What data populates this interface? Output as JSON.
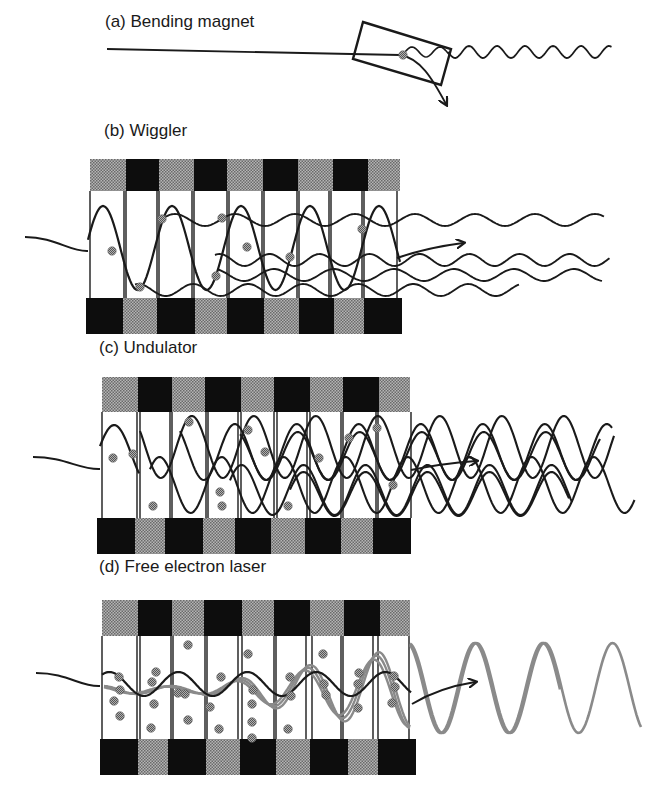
{
  "figure": {
    "colors": {
      "line": "#1a1a1a",
      "magnet_dark": "#0d0d0d",
      "magnet_light": "#8f8f8f",
      "electron": "#7a7a7a",
      "fel_wave": "#8a8a8a",
      "background": "#ffffff"
    },
    "panels": [
      {
        "id": "a",
        "label": "(a) Bending magnet",
        "label_pos": [
          105,
          22
        ],
        "type": "bending-magnet",
        "beam_in": [
          [
            107,
            49
          ],
          [
            400,
            55
          ]
        ],
        "box": [
          [
            363,
            22
          ],
          [
            451,
            49
          ],
          [
            441,
            85
          ],
          [
            353,
            59
          ]
        ],
        "electron": [
          403,
          55
        ],
        "arrow_tip": [
          446,
          106
        ],
        "emitted_wave": {
          "x0": 448,
          "x1": 612,
          "y": 52,
          "amp": 6,
          "period": 28
        }
      },
      {
        "id": "b",
        "label": "(b) Wiggler",
        "label_pos": [
          104,
          131
        ],
        "type": "wiggler",
        "top_magnets": {
          "x0": 90,
          "y": 159,
          "h": 32,
          "widths": [
            36,
            33,
            35,
            33,
            36,
            35,
            35,
            35,
            32
          ],
          "start": "light"
        },
        "bottom_magnets": {
          "x0": 86,
          "y": 298,
          "h": 36,
          "widths": [
            37,
            34,
            38,
            32,
            37,
            35,
            35,
            30,
            38
          ],
          "start": "dark"
        },
        "gap": {
          "y0": 191,
          "y1": 298
        },
        "dividers": [
          90,
          124,
          126,
          157,
          159,
          192,
          194,
          227,
          229,
          262,
          264,
          297,
          299,
          329,
          331,
          362,
          364,
          397
        ],
        "wave_count": 4,
        "arrow": {
          "from": [
            400,
            253
          ],
          "to": [
            465,
            243
          ]
        },
        "electrons": [
          [
            112,
            251
          ],
          [
            140,
            287
          ],
          [
            162,
            219
          ],
          [
            216,
            276
          ],
          [
            222,
            218
          ],
          [
            247,
            247
          ],
          [
            290,
            257
          ],
          [
            362,
            229
          ]
        ]
      },
      {
        "id": "c",
        "label": "(c) Undulator",
        "label_pos": [
          99,
          348
        ],
        "type": "undulator",
        "top_magnets": {
          "x0": 102,
          "y": 377,
          "h": 35,
          "widths": [
            36,
            34,
            33,
            36,
            33,
            36,
            33,
            36,
            31
          ],
          "start": "light"
        },
        "bottom_magnets": {
          "x0": 97,
          "y": 518,
          "h": 36,
          "widths": [
            38,
            30,
            38,
            32,
            36,
            34,
            36,
            32,
            38
          ],
          "start": "dark"
        },
        "gap": {
          "y0": 412,
          "y1": 518
        },
        "dividers": [
          102,
          137,
          140,
          170,
          172,
          206,
          208,
          238,
          241,
          274,
          277,
          307,
          310,
          341,
          343,
          376,
          378,
          411
        ],
        "arrow": {
          "from": [
            410,
            468
          ],
          "to": [
            478,
            460
          ]
        },
        "electrons": [
          [
            113,
            458
          ],
          [
            133,
            454
          ],
          [
            153,
            506
          ],
          [
            189,
            422
          ],
          [
            220,
            492
          ],
          [
            222,
            506
          ],
          [
            248,
            430
          ],
          [
            265,
            452
          ],
          [
            288,
            506
          ],
          [
            319,
            458
          ],
          [
            349,
            438
          ],
          [
            377,
            428
          ],
          [
            393,
            485
          ]
        ]
      },
      {
        "id": "d",
        "label": "(d) Free electron laser",
        "label_pos": [
          99,
          567
        ],
        "type": "free-electron-laser",
        "top_magnets": {
          "x0": 102,
          "y": 600,
          "h": 36,
          "widths": [
            36,
            34,
            32,
            38,
            32,
            36,
            34,
            36,
            30
          ],
          "start": "light"
        },
        "bottom_magnets": {
          "x0": 100,
          "y": 739,
          "h": 36,
          "widths": [
            38,
            30,
            38,
            34,
            36,
            34,
            38,
            30,
            38
          ],
          "start": "dark"
        },
        "gap": {
          "y0": 636,
          "y1": 739
        },
        "dividers": [
          102,
          137,
          140,
          171,
          173,
          205,
          207,
          238,
          242,
          274,
          276,
          306,
          312,
          341,
          343,
          373,
          378,
          409
        ],
        "arrow": {
          "from": [
            412,
            704
          ],
          "to": [
            476,
            680
          ]
        },
        "emitted_wave": {
          "x0": 410,
          "x1": 641,
          "y": 688,
          "amp": 45,
          "period": 68
        },
        "electrons": [
          [
            119,
            677
          ],
          [
            120,
            690
          ],
          [
            114,
            701
          ],
          [
            120,
            716
          ],
          [
            156,
            672
          ],
          [
            152,
            682
          ],
          [
            154,
            704
          ],
          [
            151,
            728
          ],
          [
            188,
            645
          ],
          [
            178,
            693
          ],
          [
            185,
            694
          ],
          [
            188,
            720
          ],
          [
            210,
            707
          ],
          [
            221,
            677
          ],
          [
            219,
            729
          ],
          [
            248,
            654
          ],
          [
            253,
            690
          ],
          [
            252,
            704
          ],
          [
            252,
            722
          ],
          [
            252,
            738
          ],
          [
            290,
            677
          ],
          [
            291,
            696
          ],
          [
            288,
            729
          ],
          [
            323,
            654
          ],
          [
            324,
            684
          ],
          [
            326,
            695
          ],
          [
            359,
            673
          ],
          [
            358,
            684
          ],
          [
            358,
            708
          ],
          [
            394,
            676
          ],
          [
            395,
            687
          ],
          [
            392,
            703
          ]
        ]
      }
    ]
  }
}
